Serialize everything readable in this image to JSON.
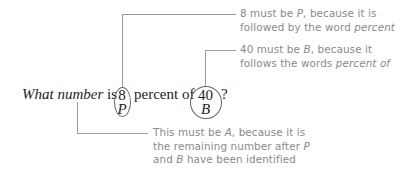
{
  "question": {
    "lead_italic": "What number",
    "word_is": "is",
    "word_percent_of": "percent of",
    "question_mark": "?",
    "percent_value": "8",
    "percent_label": "P",
    "base_value": "40",
    "base_label": "B"
  },
  "annotations": [
    {
      "target": "8",
      "line1_pre": "8 must be ",
      "line1_italic": "P",
      "line1_post": ", because it is",
      "line2_pre": "followed by the word ",
      "line2_italic": "percent"
    },
    {
      "target": "40",
      "line1_pre": "40 must be ",
      "line1_italic": "B",
      "line1_post": ", because it",
      "line2_pre": "follows the words ",
      "line2_italic": "percent of"
    },
    {
      "target": "What number",
      "line1_pre": "This must be ",
      "line1_italic": "A",
      "line1_post": ", because it is",
      "line2_pre": "the remaining number after ",
      "line2_italic": "P",
      "line3_pre": "and ",
      "line3_italic": "B",
      "line3_post": " have been identified"
    }
  ],
  "colors": {
    "leader_line": "#9a9a9a",
    "note_text": "#8a8a8a",
    "question_text": "#222222"
  }
}
